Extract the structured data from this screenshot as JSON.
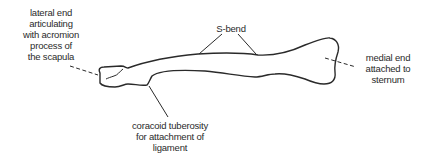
{
  "diagram": {
    "labels": {
      "lateral_end": [
        "lateral end",
        "articulating",
        "with acromion",
        "process of",
        "the scapula"
      ],
      "s_bend": [
        "S-bend"
      ],
      "medial_end": [
        "medial end",
        "attached to",
        "sternum"
      ],
      "coracoid_tuberosity": [
        "coracoid tuberosity",
        "for attachment of",
        "ligament"
      ]
    },
    "colors": {
      "line": "#2a2a2a",
      "background": "#ffffff"
    }
  }
}
